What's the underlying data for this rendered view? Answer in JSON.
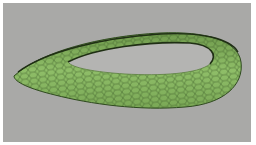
{
  "image": {
    "subject": "3D render of a curved hexagonal-mesh shell (saddle/torus-like ring) on a gray background",
    "colors": {
      "background": "#a9a9a7",
      "border": "#ffffff",
      "surface": "#7fae5a",
      "surface_light": "#93c06a",
      "mesh_lines": "#3f5f2a",
      "hole": "#b4b4b2"
    }
  }
}
